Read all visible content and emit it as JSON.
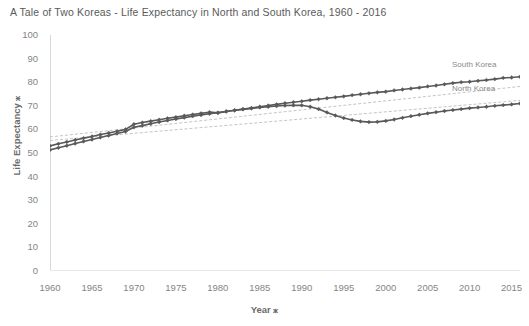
{
  "chart_data": {
    "type": "line",
    "title": "A Tale of Two Koreas - Life Expectancy in North and South Korea, 1960 - 2016",
    "xlabel": "Year ⁎",
    "ylabel": "Life Expectancy ⁎",
    "xlim": [
      1960,
      2016
    ],
    "ylim": [
      0,
      100
    ],
    "grid": false,
    "legend_position": "inline-right-end-labels",
    "yticks": [
      100,
      90,
      80,
      70,
      60,
      50,
      40,
      30,
      20,
      10,
      0
    ],
    "xticks": [
      1960,
      1965,
      1970,
      1975,
      1980,
      1985,
      1990,
      1995,
      2000,
      2005,
      2010,
      2015
    ],
    "marker": "diamond",
    "line_color": "#595959",
    "trendline_color": "#b5b5b5",
    "x": [
      1960,
      1961,
      1962,
      1963,
      1964,
      1965,
      1966,
      1967,
      1968,
      1969,
      1970,
      1971,
      1972,
      1973,
      1974,
      1975,
      1976,
      1977,
      1978,
      1979,
      1980,
      1981,
      1982,
      1983,
      1984,
      1985,
      1986,
      1987,
      1988,
      1989,
      1990,
      1991,
      1992,
      1993,
      1994,
      1995,
      1996,
      1997,
      1998,
      1999,
      2000,
      2001,
      2002,
      2003,
      2004,
      2005,
      2006,
      2007,
      2008,
      2009,
      2010,
      2011,
      2012,
      2013,
      2014,
      2015,
      2016
    ],
    "series": [
      {
        "name": "South Korea",
        "label": "South Korea",
        "values": [
          53.0,
          53.9,
          54.7,
          55.5,
          56.3,
          57.0,
          57.8,
          58.5,
          59.2,
          60.0,
          62.2,
          62.9,
          63.5,
          64.1,
          64.7,
          65.2,
          65.8,
          66.3,
          66.8,
          67.3,
          67.0,
          67.6,
          68.1,
          68.6,
          69.1,
          69.6,
          70.1,
          70.6,
          71.1,
          71.5,
          71.9,
          72.4,
          72.8,
          73.2,
          73.6,
          74.0,
          74.5,
          74.9,
          75.3,
          75.7,
          76.0,
          76.5,
          76.9,
          77.3,
          77.7,
          78.2,
          78.6,
          79.1,
          79.6,
          80.0,
          80.2,
          80.6,
          80.9,
          81.3,
          81.8,
          82.0,
          82.3
        ]
      },
      {
        "name": "North Korea",
        "label": "North Korea",
        "values": [
          51.3,
          52.2,
          53.1,
          54.0,
          54.9,
          55.7,
          56.6,
          57.4,
          58.3,
          59.1,
          60.9,
          61.6,
          62.4,
          63.1,
          63.8,
          64.4,
          65.0,
          65.6,
          66.1,
          66.6,
          67.1,
          67.6,
          68.1,
          68.5,
          68.9,
          69.3,
          69.6,
          69.9,
          70.1,
          70.2,
          70.2,
          69.6,
          68.6,
          67.2,
          65.9,
          64.8,
          64.0,
          63.4,
          63.1,
          63.2,
          63.6,
          64.2,
          64.9,
          65.6,
          66.2,
          66.8,
          67.3,
          67.8,
          68.2,
          68.6,
          69.0,
          69.3,
          69.6,
          70.0,
          70.3,
          70.6,
          71.0
        ]
      }
    ],
    "trendlines": [
      {
        "name": "South Korea trendline",
        "from": [
          1960,
          56.8
        ],
        "to": [
          2016,
          78.2
        ]
      },
      {
        "name": "North Korea trendline",
        "from": [
          1960,
          55.3
        ],
        "to": [
          2016,
          72.3
        ]
      }
    ]
  }
}
